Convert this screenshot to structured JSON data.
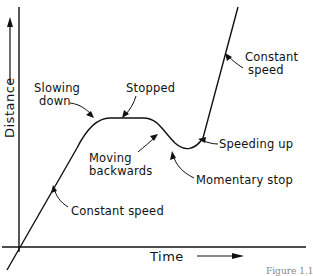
{
  "diagram": {
    "x_axis_label": "Time",
    "y_axis_label": "Distance",
    "annotations": [
      {
        "id": "constant-speed-1",
        "text": "Constant speed"
      },
      {
        "id": "slowing-down",
        "line1": "Slowing",
        "line2": "down"
      },
      {
        "id": "stopped",
        "text": "Stopped"
      },
      {
        "id": "moving-backwards",
        "line1": "Moving",
        "line2": "backwards"
      },
      {
        "id": "momentary-stop",
        "text": "Momentary stop"
      },
      {
        "id": "speeding-up",
        "text": "Speeding up"
      },
      {
        "id": "constant-speed-2",
        "line1": "Constant",
        "line2": "speed"
      }
    ],
    "caption": "Figure 1.1",
    "line_color": "#111111"
  }
}
